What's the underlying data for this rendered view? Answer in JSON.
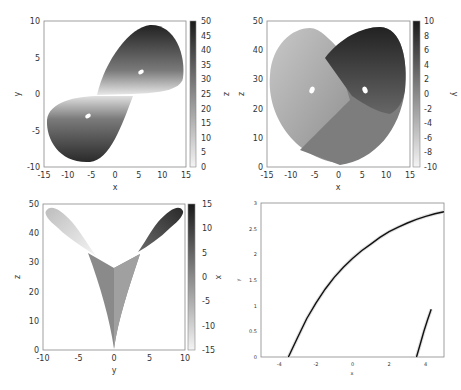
{
  "chart_data": [
    {
      "type": "heatmap",
      "panel": "top-left",
      "title": "",
      "xlabel": "x",
      "ylabel": "y",
      "colorbar_label": "z",
      "xlim": [
        -15,
        15
      ],
      "ylim": [
        -10,
        10
      ],
      "xticks": [
        "-15",
        "-10",
        "-5",
        "0",
        "5",
        "10",
        "15"
      ],
      "yticks": [
        "-10",
        "-5",
        "0",
        "5",
        "10"
      ],
      "colorbar_range": [
        0,
        50
      ],
      "colorbar_ticks": [
        "0",
        "5",
        "10",
        "15",
        "20",
        "25",
        "30",
        "35",
        "40",
        "45",
        "50"
      ],
      "description": "Lorenz attractor projection onto x-y plane colored by z; two lobes with holes near (-6,-3) and (6,3)"
    },
    {
      "type": "heatmap",
      "panel": "top-right",
      "title": "",
      "xlabel": "x",
      "ylabel": "z",
      "colorbar_label": "y",
      "xlim": [
        -15,
        15
      ],
      "ylim": [
        0,
        50
      ],
      "xticks": [
        "-15",
        "-10",
        "-5",
        "0",
        "5",
        "10",
        "15"
      ],
      "yticks": [
        "0",
        "10",
        "20",
        "30",
        "40",
        "50"
      ],
      "colorbar_range": [
        -10,
        10
      ],
      "colorbar_ticks": [
        "-10",
        "-8",
        "-6",
        "-4",
        "-2",
        "0",
        "2",
        "4",
        "6",
        "8",
        "10"
      ],
      "description": "Lorenz attractor projection onto x-z plane colored by y; butterfly shape with holes near (-6,27) and (6,27)"
    },
    {
      "type": "heatmap",
      "panel": "bottom-left",
      "title": "",
      "xlabel": "y",
      "ylabel": "z",
      "colorbar_label": "x",
      "xlim": [
        -10,
        10
      ],
      "ylim": [
        0,
        50
      ],
      "xticks": [
        "-10",
        "-5",
        "0",
        "5",
        "10"
      ],
      "yticks": [
        "0",
        "10",
        "20",
        "30",
        "40",
        "50"
      ],
      "colorbar_range": [
        -15,
        15
      ],
      "colorbar_ticks": [
        "-15",
        "-10",
        "-5",
        "0",
        "5",
        "10",
        "15"
      ],
      "description": "Lorenz attractor projection onto y-z plane colored by x; V shape with wings toward (-9,47) and (9,47)"
    },
    {
      "type": "line",
      "panel": "bottom-right",
      "title": "",
      "xlabel": "x",
      "ylabel": "y",
      "xlim": [
        -5,
        5
      ],
      "ylim": [
        0,
        3
      ],
      "xticks": [
        "-4",
        "-2",
        "0",
        "2",
        "4"
      ],
      "yticks": [
        "0",
        "0.5",
        "1",
        "1.5",
        "2",
        "2.5",
        "3"
      ],
      "series": [
        {
          "name": "curve-1",
          "x": [
            -3.5,
            -3.0,
            -2.5,
            -2.0,
            -1.5,
            -1.0,
            -0.5,
            0.0,
            0.5,
            1.0,
            1.5,
            2.0,
            2.5,
            3.0,
            3.5,
            4.0,
            4.5,
            5.0
          ],
          "y": [
            0.0,
            0.38,
            0.75,
            1.05,
            1.32,
            1.55,
            1.75,
            1.92,
            2.07,
            2.2,
            2.33,
            2.44,
            2.53,
            2.61,
            2.68,
            2.74,
            2.79,
            2.83
          ]
        },
        {
          "name": "curve-2",
          "x": [
            3.5,
            3.7,
            3.9,
            4.1,
            4.3
          ],
          "y": [
            0.0,
            0.25,
            0.5,
            0.72,
            0.93
          ]
        }
      ]
    }
  ]
}
